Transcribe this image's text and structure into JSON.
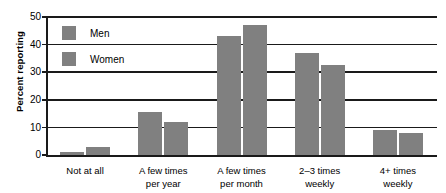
{
  "chart_data": {
    "type": "bar",
    "title": "",
    "xlabel": "",
    "ylabel": "Percent reporting",
    "categories": [
      "Not at all",
      "A few times per year",
      "A few times per month",
      "2–3 times weekly",
      "4+ times weekly"
    ],
    "category_lines": [
      [
        "Not at all"
      ],
      [
        "A few times",
        "per year"
      ],
      [
        "A few times",
        "per month"
      ],
      [
        "2–3 times",
        "weekly"
      ],
      [
        "4+ times",
        "weekly"
      ]
    ],
    "series": [
      {
        "name": "Men",
        "values": [
          1,
          15.5,
          43,
          37,
          9
        ]
      },
      {
        "name": "Women",
        "values": [
          3,
          12,
          47,
          32.5,
          8
        ]
      }
    ],
    "ylim": [
      0,
      50
    ],
    "yticks": [
      0,
      10,
      20,
      30,
      40,
      50
    ],
    "ytick_labels": [
      "0",
      "10",
      "20",
      "30",
      "40",
      "50"
    ],
    "grid": true,
    "grid_axis": "y",
    "legend_position": "upper-left-inside",
    "bar_color": "#808080",
    "axis_color": "#1a1a1a",
    "background": "#ffffff"
  },
  "legend": {
    "entries": [
      {
        "label": "Men",
        "color": "#808080"
      },
      {
        "label": "Women",
        "color": "#808080"
      }
    ]
  }
}
